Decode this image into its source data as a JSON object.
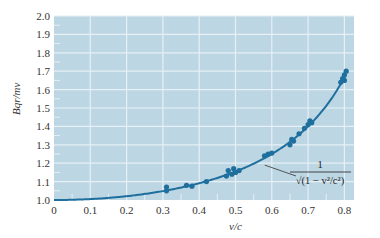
{
  "chart_data": {
    "type": "scatter",
    "title": "",
    "xlabel": "v/c",
    "ylabel": "Bqr/mv",
    "xlim": [
      0,
      0.83
    ],
    "ylim": [
      1.0,
      2.0
    ],
    "grid": true,
    "x_ticks": [
      "0",
      "0.1",
      "0.2",
      "0.3",
      "0.4",
      "0.5",
      "0.6",
      "0.7",
      "0.8"
    ],
    "y_ticks": [
      "1.0",
      "1.1",
      "1.2",
      "1.3",
      "1.4",
      "1.5",
      "1.6",
      "1.7",
      "1.8",
      "1.9",
      "2.0"
    ],
    "series": [
      {
        "name": "Measured data",
        "kind": "scatter",
        "x": [
          0.31,
          0.31,
          0.365,
          0.38,
          0.42,
          0.475,
          0.48,
          0.49,
          0.495,
          0.5,
          0.51,
          0.58,
          0.59,
          0.6,
          0.65,
          0.655,
          0.66,
          0.675,
          0.69,
          0.7,
          0.705,
          0.71,
          0.79,
          0.795,
          0.8,
          0.8,
          0.805
        ],
        "y": [
          1.05,
          1.07,
          1.08,
          1.075,
          1.1,
          1.13,
          1.16,
          1.14,
          1.17,
          1.15,
          1.16,
          1.24,
          1.25,
          1.255,
          1.3,
          1.33,
          1.32,
          1.36,
          1.39,
          1.41,
          1.43,
          1.42,
          1.64,
          1.66,
          1.65,
          1.68,
          1.7
        ]
      },
      {
        "name": "Theory curve",
        "kind": "line",
        "formula": "1/sqrt(1 - v^2/c^2)"
      }
    ],
    "annotations": [
      {
        "text_numerator": "1",
        "text_denominator": "√(1 − v²/c²)",
        "points_to_x": 0.575
      }
    ]
  },
  "colors": {
    "plot_background": "#bdd6e3",
    "grid": "#e6f0f5",
    "data": "#1f6f9e",
    "curve": "#1f6f9e",
    "text": "#333333"
  }
}
